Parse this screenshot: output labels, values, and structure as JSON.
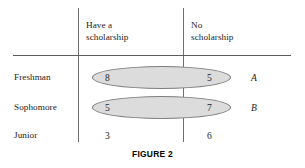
{
  "figure": {
    "caption": "FIGURE 2"
  },
  "table": {
    "corner_label": "",
    "column_headers": [
      {
        "line1": "Have a",
        "line2": "scholarship"
      },
      {
        "line1": "No",
        "line2": "scholarship"
      }
    ],
    "rows": [
      {
        "label": "Freshman",
        "values": [
          "8",
          "5"
        ],
        "group_tag": "A",
        "grouped": true
      },
      {
        "label": "Sophomore",
        "values": [
          "5",
          "7"
        ],
        "group_tag": "B",
        "grouped": true
      },
      {
        "label": "Junior",
        "values": [
          "3",
          "6"
        ],
        "group_tag": "",
        "grouped": false
      }
    ]
  },
  "chart_data": {
    "type": "table",
    "title": "FIGURE 2",
    "categories": [
      "Freshman",
      "Sophomore",
      "Junior"
    ],
    "column_labels": [
      "Have a scholarship",
      "No scholarship"
    ],
    "values": [
      [
        8,
        5
      ],
      [
        5,
        7
      ],
      [
        3,
        6
      ]
    ],
    "annotations": [
      {
        "label": "A",
        "rows": [
          "Freshman"
        ],
        "shape": "ellipse",
        "fill": "#dcdcdc"
      },
      {
        "label": "B",
        "rows": [
          "Sophomore"
        ],
        "shape": "ellipse",
        "fill": "#dcdcdc"
      }
    ],
    "grid": false,
    "legend": "none"
  },
  "colors": {
    "background": "#ffffff",
    "rule": "#6e6e6e",
    "ellipse_fill": "#dcdcdc",
    "ellipse_stroke": "#7d7d7d",
    "text": "#1c1c1c"
  }
}
